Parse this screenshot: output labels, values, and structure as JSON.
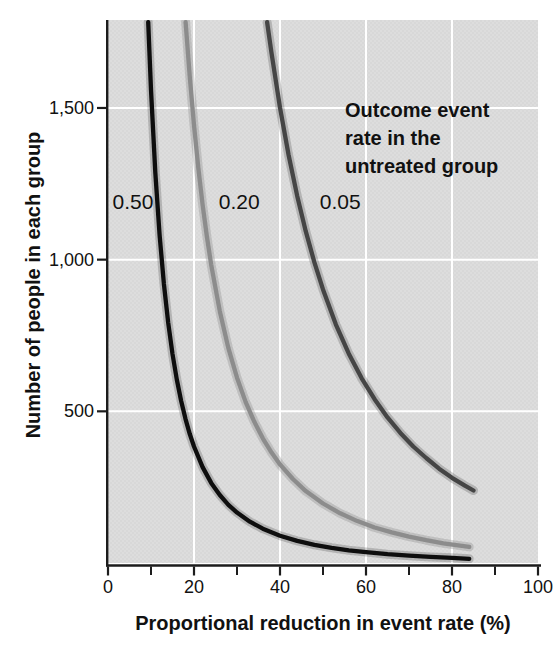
{
  "page": {
    "background": "#ffffff"
  },
  "chart_data": {
    "type": "line",
    "title": "",
    "xlabel": "Proportional reduction in event rate (%)",
    "ylabel": "Number of people in each group",
    "xlim": [
      0,
      100
    ],
    "ylim": [
      0,
      1790
    ],
    "grid": {
      "on": true,
      "x": [
        20,
        40,
        60,
        80
      ],
      "y": [
        500,
        1000,
        1500
      ],
      "color": "#ffffff"
    },
    "plot_bg": "#dddddd",
    "plot_bg_dot": "#cfcfcf",
    "axis_color": "#1c1c1c",
    "text_color": "#111111",
    "x_ticks": [
      {
        "value": 0,
        "label": "0"
      },
      {
        "value": 20,
        "label": "20"
      },
      {
        "value": 40,
        "label": "40"
      },
      {
        "value": 60,
        "label": "60"
      },
      {
        "value": 80,
        "label": "80"
      },
      {
        "value": 100,
        "label": "100"
      }
    ],
    "x_minor_ticks": [
      10,
      30,
      50,
      70,
      90
    ],
    "y_ticks": [
      {
        "value": 500,
        "label": "500"
      },
      {
        "value": 1000,
        "label": "1,000"
      },
      {
        "value": 1500,
        "label": "1,500"
      }
    ],
    "annotation": {
      "lines": [
        "Outcome event",
        "rate in the",
        "untreated group"
      ]
    },
    "series": [
      {
        "name": "0.50",
        "color": "#0e0e0e",
        "halo": "rgba(40,40,40,0.22)",
        "label_pos": {
          "x": 5.8,
          "y": 1190
        },
        "points": [
          [
            9.35,
            1783
          ],
          [
            10,
            1560
          ],
          [
            11,
            1288
          ],
          [
            12,
            1081
          ],
          [
            13,
            920
          ],
          [
            14,
            792
          ],
          [
            15,
            689
          ],
          [
            16,
            605
          ],
          [
            17,
            535
          ],
          [
            18,
            476
          ],
          [
            19,
            426
          ],
          [
            20,
            384
          ],
          [
            22,
            316
          ],
          [
            24,
            264
          ],
          [
            26,
            224
          ],
          [
            28,
            192
          ],
          [
            30,
            166
          ],
          [
            33,
            136
          ],
          [
            36,
            113
          ],
          [
            40,
            90
          ],
          [
            44,
            73
          ],
          [
            48,
            60
          ],
          [
            52,
            50
          ],
          [
            56,
            42
          ],
          [
            60,
            36
          ],
          [
            65,
            29
          ],
          [
            70,
            24
          ],
          [
            75,
            20
          ],
          [
            80,
            17
          ],
          [
            84,
            14
          ]
        ]
      },
      {
        "name": "0.20",
        "color": "#8c8c8c",
        "halo": "rgba(140,140,140,0.35)",
        "label_pos": {
          "x": 30.5,
          "y": 1190
        },
        "points": [
          [
            18.05,
            1783
          ],
          [
            19,
            1606
          ],
          [
            20,
            1443
          ],
          [
            21,
            1303
          ],
          [
            22,
            1181
          ],
          [
            23,
            1076
          ],
          [
            24,
            983
          ],
          [
            26,
            830
          ],
          [
            28,
            708
          ],
          [
            30,
            611
          ],
          [
            32,
            531
          ],
          [
            34,
            466
          ],
          [
            36,
            411
          ],
          [
            38,
            365
          ],
          [
            40,
            325
          ],
          [
            43,
            277
          ],
          [
            46,
            237
          ],
          [
            50,
            196
          ],
          [
            54,
            164
          ],
          [
            58,
            138
          ],
          [
            62,
            117
          ],
          [
            66,
            101
          ],
          [
            70,
            87
          ],
          [
            74,
            75
          ],
          [
            78,
            65
          ],
          [
            81,
            59
          ],
          [
            84,
            53
          ]
        ]
      },
      {
        "name": "0.05",
        "color": "#454545",
        "halo": "rgba(90,90,90,0.30)",
        "label_pos": {
          "x": 54,
          "y": 1190
        },
        "points": [
          [
            37,
            1783
          ],
          [
            38,
            1684
          ],
          [
            40,
            1501
          ],
          [
            42,
            1345
          ],
          [
            44,
            1210
          ],
          [
            46,
            1093
          ],
          [
            48,
            991
          ],
          [
            50,
            902
          ],
          [
            53,
            786
          ],
          [
            56,
            690
          ],
          [
            59,
            609
          ],
          [
            62,
            540
          ],
          [
            65,
            480
          ],
          [
            68,
            429
          ],
          [
            71,
            384
          ],
          [
            74,
            346
          ],
          [
            77,
            311
          ],
          [
            80,
            281
          ],
          [
            83,
            255
          ],
          [
            85,
            239
          ]
        ]
      }
    ]
  }
}
